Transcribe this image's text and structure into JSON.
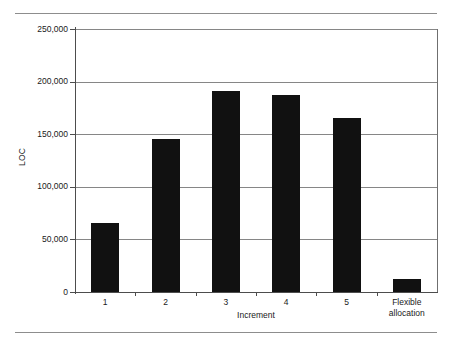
{
  "chart_data": {
    "type": "bar",
    "title": "",
    "subtitle": "",
    "xlabel": "Increment",
    "ylabel": "LOC",
    "categories": [
      "1",
      "2",
      "3",
      "4",
      "5",
      "Flexible allocation"
    ],
    "category_lines": [
      [
        "1"
      ],
      [
        "2"
      ],
      [
        "3"
      ],
      [
        "4"
      ],
      [
        "5"
      ],
      [
        "Flexible",
        "allocation"
      ]
    ],
    "values": [
      66000,
      145000,
      191000,
      187000,
      165000,
      12000
    ],
    "ylim": [
      0,
      250000
    ],
    "ytick_values": [
      0,
      50000,
      100000,
      150000,
      200000,
      250000
    ],
    "ytick_labels": [
      "0",
      "50,000",
      "100,000",
      "150,000",
      "200,000",
      "250,000"
    ],
    "grid": true,
    "grid_axis": "y",
    "legend": false,
    "legend_position": "none",
    "bar_color": "#111111",
    "grid_color": "#868686",
    "axis_color": "#4d4d4d",
    "rule_color": "#8d8d8d",
    "background": "#ffffff"
  }
}
